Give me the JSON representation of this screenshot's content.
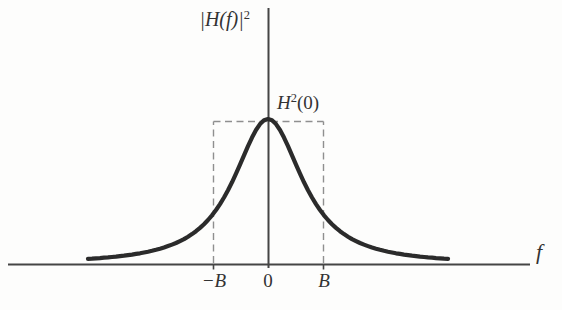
{
  "figure": {
    "y_axis_label": {
      "base": "|H(f)|",
      "sup": "2"
    },
    "peak_label": {
      "base": "H",
      "sup": "2",
      "arg": "(0)"
    },
    "x_axis_label": "f",
    "x_ticks": [
      "−B",
      "0",
      "B"
    ]
  },
  "colors": {
    "background": "#fdfdfc",
    "curve": "#2b2b2b",
    "axis": "#454545",
    "dashed": "#8f8f8f",
    "text": "#333333"
  }
}
